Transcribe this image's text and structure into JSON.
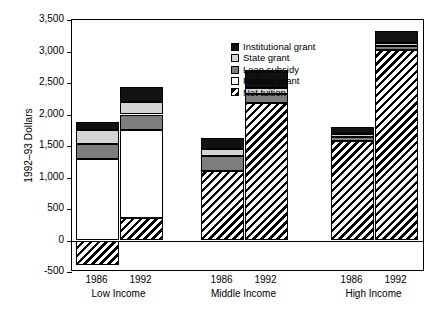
{
  "chart_data": {
    "type": "bar",
    "subtype": "stacked-bar",
    "title": "",
    "xlabel": "",
    "ylabel": "1992–93 Dollars",
    "ylim": [
      -500,
      3500
    ],
    "ytick_step": 500,
    "ytick_labels": [
      "3,500",
      "3,000",
      "2,500",
      "2,000",
      "1,500",
      "1,000",
      "500",
      "0",
      "-500"
    ],
    "ytick_values": [
      3500,
      3000,
      2500,
      2000,
      1500,
      1000,
      500,
      0,
      -500
    ],
    "grid": false,
    "legend_position": "top-center-inside",
    "stack_order_bottom_to_top": [
      "Net tuition",
      "Federal grant",
      "Loan subsidy",
      "State grant",
      "Institutional grant"
    ],
    "groups": [
      "Low Income",
      "Middle Income",
      "High Income"
    ],
    "categories": [
      "1986",
      "1992",
      "1986",
      "1992",
      "1986",
      "1992"
    ],
    "series": [
      {
        "name": "Net tuition",
        "swatch": "hatched",
        "color": "#ffffff",
        "values": [
          -390,
          359,
          1109,
          2187,
          1578,
          3031
        ]
      },
      {
        "name": "Federal grant",
        "swatch": "solid",
        "color": "#ffffff",
        "values": [
          1297,
          1391,
          0,
          0,
          0,
          0
        ]
      },
      {
        "name": "Loan subsidy",
        "swatch": "solid",
        "color": "#7d7d7d",
        "values": [
          234,
          250,
          235,
          141,
          63,
          63
        ]
      },
      {
        "name": "State grant",
        "swatch": "solid",
        "color": "#d4d4d4",
        "values": [
          219,
          203,
          109,
          94,
          46,
          47
        ]
      },
      {
        "name": "Institutional grant",
        "swatch": "solid",
        "color": "#111111",
        "values": [
          125,
          234,
          172,
          281,
          110,
          187
        ]
      }
    ],
    "bar_totals": [
      1875,
      2437,
      1625,
      2703,
      1797,
      3328
    ],
    "legend": [
      {
        "label": "Institutional grant",
        "swatch": "solid",
        "color": "#111111"
      },
      {
        "label": "State grant",
        "swatch": "solid",
        "color": "#d4d4d4"
      },
      {
        "label": "Loan subsidy",
        "swatch": "solid",
        "color": "#7d7d7d"
      },
      {
        "label": "Federal grant",
        "swatch": "solid",
        "color": "#ffffff"
      },
      {
        "label": "Net tuition",
        "swatch": "hatched",
        "color": "#ffffff"
      }
    ],
    "x_axis_groups": [
      {
        "group_label": "Low Income",
        "years": [
          "1986",
          "1992"
        ]
      },
      {
        "group_label": "Middle Income",
        "years": [
          "1986",
          "1992"
        ]
      },
      {
        "group_label": "High Income",
        "years": [
          "1986",
          "1992"
        ]
      }
    ]
  }
}
